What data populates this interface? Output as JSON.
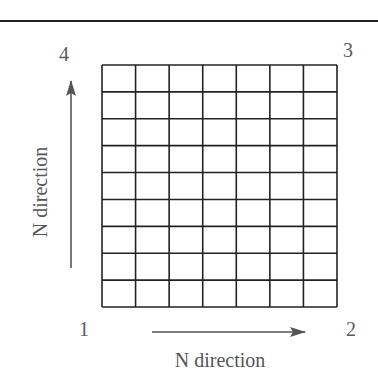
{
  "diagram": {
    "corners": [
      {
        "id": "1",
        "label": "1",
        "position": "bottom-left"
      },
      {
        "id": "2",
        "label": "2",
        "position": "bottom-right"
      },
      {
        "id": "3",
        "label": "3",
        "position": "top-right"
      },
      {
        "id": "4",
        "label": "4",
        "position": "top-left"
      }
    ],
    "grid": {
      "columns": 7,
      "rows": 9
    },
    "axes": {
      "horizontal_label": "N direction",
      "vertical_label": "N direction"
    },
    "colors": {
      "lines": "#222222",
      "text": "#555555",
      "arrows": "#555555"
    }
  }
}
